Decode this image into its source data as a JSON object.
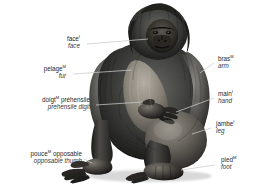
{
  "figure": {
    "background_color": "#ffffff",
    "leader_line_color": "#c9c9c9",
    "text_color": "#2b2b2b"
  },
  "labels": [
    {
      "id": "face",
      "fr": "face",
      "fr_gender": "f",
      "en": "face",
      "side": "left"
    },
    {
      "id": "pelage",
      "fr": "pelage",
      "fr_gender": "M",
      "en": "fur",
      "side": "left"
    },
    {
      "id": "prehensile-digit",
      "fr": "doigt",
      "fr_gender": "M",
      "fr_rest": " préhensile",
      "en": "prehensile digit",
      "side": "left"
    },
    {
      "id": "opposable-thumb",
      "fr": "pouce",
      "fr_gender": "M",
      "fr_rest": " opposable",
      "en": "opposable thumb",
      "side": "left"
    },
    {
      "id": "arm",
      "fr": "bras",
      "fr_gender": "M",
      "en": "arm",
      "side": "right"
    },
    {
      "id": "hand",
      "fr": "main",
      "fr_gender": "f",
      "en": "hand",
      "side": "right"
    },
    {
      "id": "leg",
      "fr": "jambe",
      "fr_gender": "f",
      "en": "leg",
      "side": "right"
    },
    {
      "id": "foot",
      "fr": "pied",
      "fr_gender": "M",
      "en": "foot",
      "side": "right"
    }
  ]
}
